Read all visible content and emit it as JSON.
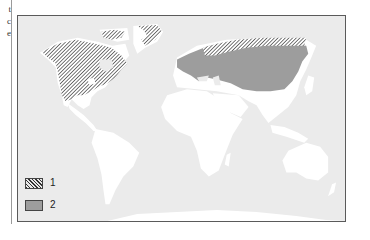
{
  "page": {
    "margin_text": [
      "t",
      "c",
      "e"
    ]
  },
  "map": {
    "type": "world distribution map",
    "colors": {
      "sea": "#ebebeb",
      "land": "#ffffff",
      "region_2_fill": "#9d9d9d",
      "hatch": "#333333",
      "frame": "#5a5a5a"
    },
    "regions": [
      {
        "id": "1",
        "style": "hatched",
        "areas": [
          "northern North America (Alaska, Canada)",
          "Greenland coast",
          "Arctic Siberia coast"
        ]
      },
      {
        "id": "2",
        "style": "gray fill",
        "areas": [
          "northern Eurasia (Scandinavia, Russia, Siberia)"
        ]
      }
    ]
  },
  "legend": [
    {
      "label": "1",
      "swatch": "hatched"
    },
    {
      "label": "2",
      "swatch": "gray"
    }
  ]
}
